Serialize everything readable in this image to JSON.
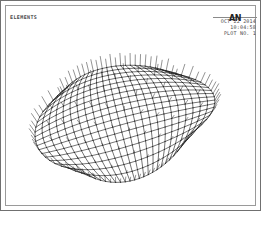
{
  "window": {
    "application": "ANSYS",
    "plot_title": "ELEMENTS"
  },
  "header": {
    "logo_text": "AN",
    "date": "OCT 22 2014",
    "time": "10:04:58",
    "plot_no": "PLOT NO.   1"
  },
  "colors": {
    "mesh_line": "#1d1d1d",
    "spike_line": "#3a3a3a",
    "frame": "#8a8a8a",
    "background": "#ffffff",
    "text": "#4a4a4a"
  },
  "chart_data": {
    "type": "mesh",
    "title": "ELEMENTS",
    "element_type": "quadrilateral shell",
    "grid_u_divisions": 24,
    "grid_v_divisions": 18,
    "node_count": 475,
    "element_count": 432,
    "surface": {
      "kind": "saddle-bowl",
      "u_range": [
        0,
        1
      ],
      "v_range": [
        0,
        1
      ],
      "center_x": 124,
      "center_y": 118,
      "radius_x": 92,
      "radius_y": 72,
      "tilt_deg": -14,
      "curvature_sag": 26,
      "curvature_twist": 18
    },
    "spikes": {
      "shown": true,
      "meaning": "element normal vectors",
      "length_px": 9,
      "boundary_only": false
    },
    "legend": [],
    "axes": {
      "shown": false
    },
    "grid": {
      "shown": false
    }
  }
}
